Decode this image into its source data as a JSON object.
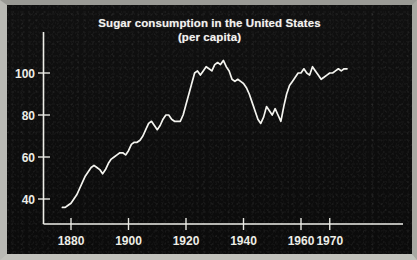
{
  "chart_data": {
    "type": "line",
    "title": "Sugar consumption in the United States",
    "subtitle": "(per capita)",
    "xlabel": "",
    "ylabel": "",
    "grid": false,
    "legend": "none",
    "xlim": [
      1877,
      1976
    ],
    "ylim": [
      28,
      112
    ],
    "xticks": [
      1880,
      1900,
      1920,
      1940,
      1960,
      1970
    ],
    "xtick_labels": [
      "1880",
      "1900",
      "1920",
      "1940",
      "1960",
      "1970"
    ],
    "yticks": [
      40,
      60,
      80,
      100
    ],
    "ytick_labels": [
      "40",
      "60",
      "80",
      "100"
    ],
    "series": [
      {
        "name": "Sugar consumption per capita",
        "x": [
          1877,
          1878,
          1879,
          1880,
          1881,
          1882,
          1883,
          1884,
          1885,
          1886,
          1887,
          1888,
          1889,
          1890,
          1891,
          1892,
          1893,
          1894,
          1895,
          1896,
          1897,
          1898,
          1899,
          1900,
          1901,
          1902,
          1903,
          1904,
          1905,
          1906,
          1907,
          1908,
          1909,
          1910,
          1911,
          1912,
          1913,
          1914,
          1915,
          1916,
          1917,
          1918,
          1919,
          1920,
          1921,
          1922,
          1923,
          1924,
          1925,
          1926,
          1927,
          1928,
          1929,
          1930,
          1931,
          1932,
          1933,
          1934,
          1935,
          1936,
          1937,
          1938,
          1939,
          1940,
          1941,
          1942,
          1943,
          1944,
          1945,
          1946,
          1947,
          1948,
          1949,
          1950,
          1951,
          1952,
          1953,
          1954,
          1955,
          1956,
          1957,
          1958,
          1959,
          1960,
          1961,
          1962,
          1963,
          1964,
          1965,
          1966,
          1967,
          1968,
          1969,
          1970,
          1971,
          1972,
          1973,
          1974,
          1975,
          1976
        ],
        "y": [
          36,
          36,
          37,
          38,
          40,
          42,
          45,
          48,
          51,
          53,
          55,
          56,
          55,
          54,
          52,
          54,
          57,
          59,
          60,
          61,
          62,
          62,
          61,
          63,
          66,
          67,
          67,
          68,
          70,
          73,
          76,
          77,
          75,
          73,
          75,
          78,
          80,
          80,
          78,
          77,
          77,
          77,
          80,
          85,
          90,
          95,
          100,
          101,
          99,
          101,
          103,
          102,
          101,
          104,
          105,
          104,
          106,
          103,
          101,
          97,
          96,
          97,
          96,
          95,
          93,
          90,
          86,
          82,
          78,
          76,
          79,
          84,
          82,
          80,
          83,
          80,
          77,
          84,
          90,
          94,
          96,
          98,
          100,
          100,
          102,
          100,
          99,
          103,
          101,
          99,
          97,
          98,
          99,
          100,
          100,
          101,
          102,
          101,
          102,
          102
        ]
      }
    ]
  },
  "axes": {
    "y_axis_name": "value-axis",
    "x_axis_name": "year-axis"
  }
}
